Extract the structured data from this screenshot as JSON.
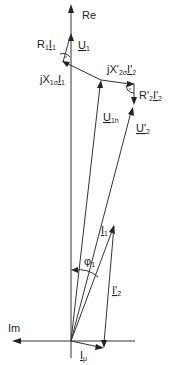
{
  "diagram": {
    "axes": {
      "re_label": "Re",
      "im_label": "Im"
    },
    "phasors": [
      {
        "id": "U1",
        "label": "U",
        "sub": "1"
      },
      {
        "id": "R1I1",
        "label": "R",
        "sub": "1",
        "label2": "I",
        "sub2": "1"
      },
      {
        "id": "jX1sI1",
        "label": "jX",
        "sub": "1σ",
        "label2": "I",
        "sub2": "1"
      },
      {
        "id": "jX2sI2",
        "label": "jX'",
        "sub": "2σ",
        "label2": "I'",
        "sub2": "2"
      },
      {
        "id": "R2I2",
        "label": "R'",
        "sub": "2",
        "label2": "I'",
        "sub2": "2"
      },
      {
        "id": "U1h",
        "label": "U",
        "sub": "1h"
      },
      {
        "id": "U2",
        "label": "U'",
        "sub": "2"
      },
      {
        "id": "I1",
        "label": "I",
        "sub": "1"
      },
      {
        "id": "I2",
        "label": "I'",
        "sub": "2"
      },
      {
        "id": "Imu",
        "label": "I",
        "sub": "μ"
      }
    ],
    "angle": {
      "label": "φ",
      "sub": "1"
    },
    "colors": {
      "line": "#333333",
      "text": "#222222",
      "background": "#ffffff"
    }
  }
}
